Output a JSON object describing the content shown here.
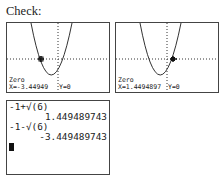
{
  "title": "Check:",
  "graph_screens": [
    {
      "mode_label": "Zero",
      "x_readout": "X=-3.44949",
      "y_readout": "Y=0",
      "marker_x": -3.44949
    },
    {
      "mode_label": "Zero",
      "x_readout": "X=1.4494897",
      "y_readout": "Y=0",
      "marker_x": 1.4494897
    }
  ],
  "home_screen": {
    "lines": [
      {
        "text": "-1+√(6)",
        "align": "left"
      },
      {
        "text": "1.449489743",
        "align": "right"
      },
      {
        "text": "-1-√(6)",
        "align": "left"
      },
      {
        "text": "-3.449489743",
        "align": "right"
      }
    ],
    "cursor": "block-cursor"
  },
  "colors": {
    "lcd_ink": "#222222",
    "lcd_bg": "#ffffff"
  }
}
